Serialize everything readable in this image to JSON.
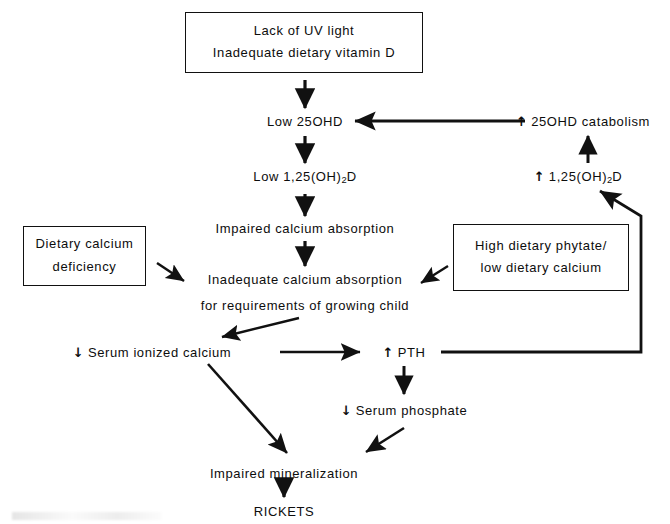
{
  "diagram": {
    "stroke_color": "#111111",
    "text_color": "#0d0d0d",
    "background": "#ffffff",
    "up_arrow_glyph": "↑",
    "down_arrow_glyph": "↓",
    "boxes": [
      {
        "id": "lack-uv",
        "line1": "Lack of UV light",
        "line2": "Inadequate dietary vitamin D",
        "x": 185,
        "y": 12,
        "w": 238,
        "h": 61
      },
      {
        "id": "dietary-calcium-deficiency",
        "line1": "Dietary calcium",
        "line2": "deficiency",
        "x": 23,
        "y": 226,
        "w": 123,
        "h": 60
      },
      {
        "id": "high-phytate",
        "line1": "High dietary phytate/",
        "line2": "low dietary calcium",
        "x": 453,
        "y": 224,
        "w": 176,
        "h": 67
      }
    ],
    "nodes": [
      {
        "id": "low-25ohd",
        "text": "Low 25OHD",
        "x": 305,
        "y": 121
      },
      {
        "id": "low-125oh2d",
        "prefix": "Low 1,25(OH)",
        "sub": "2",
        "suffix": "D",
        "x": 305,
        "y": 178
      },
      {
        "id": "impaired-calcium-absorption",
        "text": "Impaired calcium absorption",
        "x": 305,
        "y": 228
      },
      {
        "id": "inadequate-calcium-absorption-l1",
        "text": "Inadequate calcium absorption",
        "x": 305,
        "y": 279
      },
      {
        "id": "inadequate-calcium-absorption-l2",
        "text": "for requirements of growing child",
        "x": 305,
        "y": 305
      },
      {
        "id": "serum-ionized-calcium",
        "arrow": "down",
        "text": "Serum ionized calcium",
        "x": 152,
        "y": 352
      },
      {
        "id": "pth",
        "arrow": "up",
        "text": "PTH",
        "x": 404,
        "y": 352
      },
      {
        "id": "serum-phosphate",
        "arrow": "down",
        "text": "Serum phosphate",
        "x": 404,
        "y": 410
      },
      {
        "id": "impaired-mineralization",
        "text": "Impaired mineralization",
        "x": 284,
        "y": 473
      },
      {
        "id": "rickets",
        "text": "RICKETS",
        "x": 284,
        "y": 511
      },
      {
        "id": "25ohd-catabolism",
        "arrow": "up",
        "text": "25OHD catabolism",
        "x": 583,
        "y": 121
      },
      {
        "id": "high-125oh2d",
        "arrow": "up",
        "prefix": "1,25(OH)",
        "sub": "2",
        "suffix": "D",
        "x": 578,
        "y": 178
      }
    ],
    "edges": [
      {
        "id": "edge-lack-uv-to-low-25ohd",
        "from": "lack-uv",
        "to": "low-25ohd",
        "kind": "vertical"
      },
      {
        "id": "edge-low-25ohd-to-low-125oh2d",
        "from": "low-25ohd",
        "to": "low-125oh2d",
        "kind": "vertical"
      },
      {
        "id": "edge-low-125oh2d-to-impaired-absorption",
        "from": "low-125oh2d",
        "to": "impaired-calcium-absorption",
        "kind": "vertical"
      },
      {
        "id": "edge-impaired-to-inadequate",
        "from": "impaired-calcium-absorption",
        "to": "inadequate-calcium-absorption-l1",
        "kind": "vertical"
      },
      {
        "id": "edge-dietary-deficiency-to-inadequate",
        "from": "dietary-calcium-deficiency",
        "to": "inadequate-calcium-absorption-l1",
        "kind": "diagonal"
      },
      {
        "id": "edge-phytate-to-inadequate",
        "from": "high-phytate",
        "to": "inadequate-calcium-absorption-l1",
        "kind": "diagonal"
      },
      {
        "id": "edge-inadequate-to-serum-calcium",
        "from": "inadequate-calcium-absorption-l2",
        "to": "serum-ionized-calcium",
        "kind": "diagonal"
      },
      {
        "id": "edge-serum-calcium-to-pth",
        "from": "serum-ionized-calcium",
        "to": "pth",
        "kind": "horizontal"
      },
      {
        "id": "edge-serum-calcium-to-mineralization",
        "from": "serum-ionized-calcium",
        "to": "impaired-mineralization",
        "kind": "diagonal"
      },
      {
        "id": "edge-pth-to-serum-phosphate",
        "from": "pth",
        "to": "serum-phosphate",
        "kind": "vertical"
      },
      {
        "id": "edge-phosphate-to-mineralization",
        "from": "serum-phosphate",
        "to": "impaired-mineralization",
        "kind": "diagonal"
      },
      {
        "id": "edge-mineralization-to-rickets",
        "from": "impaired-mineralization",
        "to": "rickets",
        "kind": "vertical"
      },
      {
        "id": "edge-pth-to-high-125oh2d",
        "from": "pth",
        "to": "high-125oh2d",
        "kind": "elbow"
      },
      {
        "id": "edge-high-125oh2d-to-catabolism",
        "from": "high-125oh2d",
        "to": "25ohd-catabolism",
        "kind": "vertical"
      },
      {
        "id": "edge-catabolism-to-low-25ohd",
        "from": "25ohd-catabolism",
        "to": "low-25ohd",
        "kind": "horizontal"
      }
    ]
  }
}
